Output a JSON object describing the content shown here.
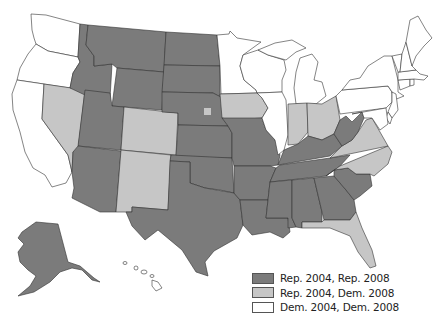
{
  "title": "",
  "colors": {
    "rep_rep": "#7b7b7b",
    "rep_dem": "#c6c6c6",
    "dem_dem": "#ffffff",
    "border": "#333333"
  },
  "legend": {
    "items": [
      {
        "key": "rep_rep",
        "label": "Rep. 2004, Rep. 2008",
        "color": "#7b7b7b"
      },
      {
        "key": "rep_dem",
        "label": "Rep. 2004, Dem. 2008",
        "color": "#c6c6c6"
      },
      {
        "key": "dem_dem",
        "label": "Dem. 2004, Dem. 2008",
        "color": "#ffffff"
      }
    ]
  },
  "states": {
    "WA": "dem_dem",
    "OR": "dem_dem",
    "CA": "dem_dem",
    "NV": "rep_dem",
    "ID": "rep_rep",
    "MT": "rep_rep",
    "WY": "rep_rep",
    "UT": "rep_rep",
    "AZ": "rep_rep",
    "CO": "rep_dem",
    "NM": "rep_dem",
    "ND": "rep_rep",
    "SD": "rep_rep",
    "NE": "rep_rep",
    "NE2": "rep_dem",
    "KS": "rep_rep",
    "OK": "rep_rep",
    "TX": "rep_rep",
    "MN": "dem_dem",
    "IA": "rep_dem",
    "MO": "rep_rep",
    "AR": "rep_rep",
    "LA": "rep_rep",
    "WI": "dem_dem",
    "IL": "dem_dem",
    "MI": "dem_dem",
    "IN": "rep_dem",
    "OH": "rep_dem",
    "KY": "rep_rep",
    "TN": "rep_rep",
    "MS": "rep_rep",
    "AL": "rep_rep",
    "GA": "rep_rep",
    "FL": "rep_dem",
    "SC": "rep_rep",
    "NC": "rep_dem",
    "VA": "rep_dem",
    "WV": "rep_rep",
    "PA": "dem_dem",
    "NY": "dem_dem",
    "NJ": "dem_dem",
    "DE": "dem_dem",
    "MD": "dem_dem",
    "CT": "dem_dem",
    "RI": "dem_dem",
    "MA": "dem_dem",
    "VT": "dem_dem",
    "NH": "dem_dem",
    "ME": "dem_dem",
    "AK": "rep_rep",
    "HI": "dem_dem"
  }
}
